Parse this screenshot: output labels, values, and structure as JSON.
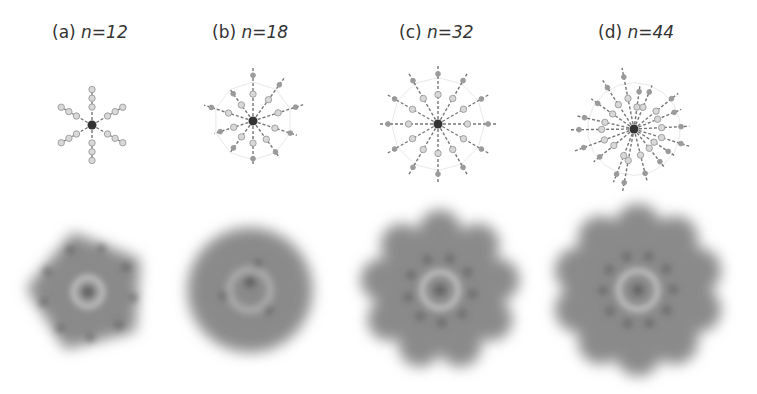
{
  "figure": {
    "panels": [
      {
        "id": "a",
        "tag": "(a)",
        "n_label": "n=12",
        "n": 12,
        "label_x": 52,
        "mol_cx": 92,
        "mol_cy": 125,
        "mol_r": 42,
        "arms": 6,
        "mol_style": "sparse",
        "dens_cx": 88,
        "dens_cy": 292,
        "dens_r": 65,
        "lobes": 5,
        "lobe_style": "pentagon"
      },
      {
        "id": "b",
        "tag": "(b)",
        "n_label": "n=18",
        "n": 18,
        "label_x": 212,
        "mol_cx": 253,
        "mol_cy": 121,
        "mol_r": 52,
        "arms": 10,
        "mol_style": "mixed",
        "dens_cx": 250,
        "dens_cy": 290,
        "dens_r": 68,
        "lobes": 0,
        "lobe_style": "blob"
      },
      {
        "id": "c",
        "tag": "(c)",
        "n_label": "n=32",
        "n": 32,
        "label_x": 399,
        "mol_cx": 438,
        "mol_cy": 124,
        "mol_r": 62,
        "arms": 12,
        "mol_style": "dense",
        "dens_cx": 440,
        "dens_cy": 290,
        "dens_r": 82,
        "lobes": 9,
        "lobe_style": "flower"
      },
      {
        "id": "d",
        "tag": "(d)",
        "n_label": "n=44",
        "n": 44,
        "label_x": 598,
        "mol_cx": 634,
        "mol_cy": 129,
        "mol_r": 62,
        "arms": 18,
        "mol_style": "very-dense",
        "dens_cx": 638,
        "dens_cy": 290,
        "dens_r": 88,
        "lobes": 10,
        "lobe_style": "flower"
      }
    ]
  },
  "colors": {
    "center_atom": "#333333",
    "bond": "#555555",
    "atom_fill": "#d8d8d8",
    "atom_stroke": "#9a9a9a",
    "density_base": "#8a8a8a",
    "density_dark": "#5a5a5a",
    "density_ring": "#c8c8c8",
    "label_text": "#333333"
  }
}
